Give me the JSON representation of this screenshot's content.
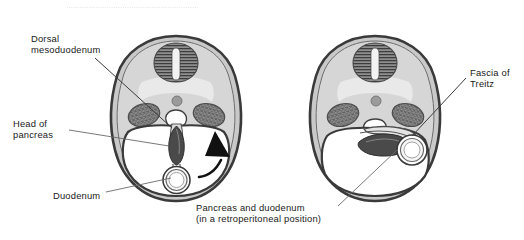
{
  "figure": {
    "kind": "anatomical-cross-section-pair",
    "top_rule": "dotted-separator"
  },
  "labels": {
    "dorsal_mesoduodenum": "Dorsal\nmesoduodenum",
    "head_of_pancreas": "Head of\npancreas",
    "duodenum": "Duodenum",
    "fascia_of_treitz": "Fascia of\nTreitz",
    "pancreas_and_duodenum": "Pancreas and duodenum\n(in a retroperitoneal position)"
  },
  "panels": [
    {
      "name": "left-panel",
      "position": "left",
      "stage": "before-rotation",
      "structures": [
        "body-wall",
        "vertebral-body",
        "spinal-cord",
        "aorta",
        "kidney-left",
        "kidney-right",
        "inferior-vena-cava",
        "dorsal-mesoduodenum",
        "head-of-pancreas",
        "duodenum",
        "peritoneal-cavity",
        "rotation-arrow"
      ]
    },
    {
      "name": "right-panel",
      "position": "right",
      "stage": "after-rotation",
      "structures": [
        "body-wall",
        "vertebral-body",
        "spinal-cord",
        "aorta",
        "kidney-left",
        "kidney-right",
        "inferior-vena-cava",
        "fascia-of-treitz",
        "head-of-pancreas",
        "duodenum",
        "peritoneal-cavity"
      ]
    }
  ],
  "colors": {
    "background": "#ffffff",
    "body_wall_outline": "#3a3a3a",
    "body_wall_fill": "#c9c9c9",
    "interior_fill": "#d2d2d2",
    "vertebra_fill": "#8a8a8a",
    "vertebra_stripe": "#3f3f3f",
    "kidney_fill": "#8d8d8d",
    "pancreas_fill": "#4a4a4a",
    "duodenum_fill": "#ffffff",
    "cavity_fill": "#ffffff",
    "mesentery_stroke": "#5a5a5a",
    "arrow_fill": "#111111",
    "leader_line": "#555555",
    "text": "#1a1a1a",
    "dotted_rule": "#b9b9b9"
  }
}
